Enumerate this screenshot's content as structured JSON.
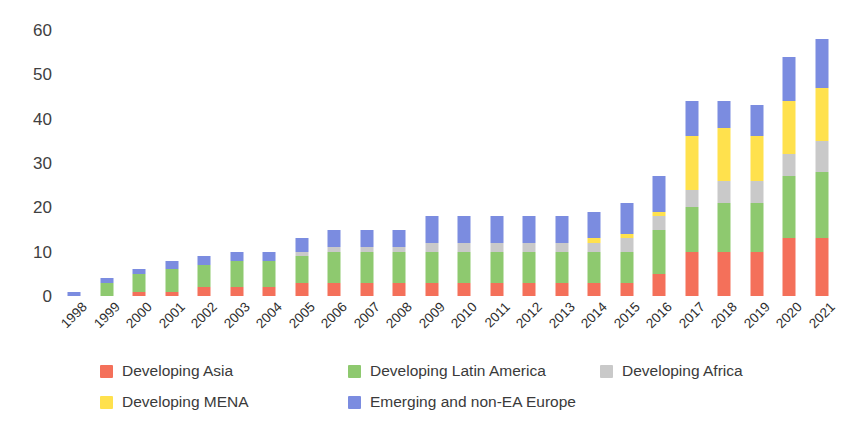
{
  "chart_data": {
    "type": "bar",
    "subtype": "stacked-bar",
    "title": "",
    "xlabel": "",
    "ylabel": "",
    "ylim": [
      0,
      60
    ],
    "yticks": [
      0,
      10,
      20,
      30,
      40,
      50,
      60
    ],
    "grid": false,
    "legend_position": "bottom",
    "categories": [
      "1998",
      "1999",
      "2000",
      "2001",
      "2002",
      "2003",
      "2004",
      "2005",
      "2006",
      "2007",
      "2008",
      "2009",
      "2010",
      "2011",
      "2012",
      "2013",
      "2014",
      "2015",
      "2016",
      "2017",
      "2018",
      "2019",
      "2020",
      "2021"
    ],
    "series": [
      {
        "name": "Developing Asia",
        "color": "#f4705a",
        "values": [
          0,
          0,
          1,
          1,
          2,
          2,
          2,
          3,
          3,
          3,
          3,
          3,
          3,
          3,
          3,
          3,
          3,
          3,
          5,
          10,
          10,
          10,
          13,
          13
        ]
      },
      {
        "name": "Developing Latin America",
        "color": "#8ec96f",
        "values": [
          0,
          3,
          4,
          5,
          5,
          6,
          6,
          6,
          7,
          7,
          7,
          7,
          7,
          7,
          7,
          7,
          7,
          7,
          10,
          10,
          11,
          11,
          14,
          15
        ]
      },
      {
        "name": "Developing Africa",
        "color": "#c9c9c9",
        "values": [
          0,
          0,
          0,
          0,
          0,
          0,
          0,
          1,
          1,
          1,
          1,
          2,
          2,
          2,
          2,
          2,
          2,
          3,
          3,
          4,
          5,
          5,
          5,
          7
        ]
      },
      {
        "name": "Developing MENA",
        "color": "#ffe14d",
        "values": [
          0,
          0,
          0,
          0,
          0,
          0,
          0,
          0,
          0,
          0,
          0,
          0,
          0,
          0,
          0,
          0,
          1,
          1,
          1,
          12,
          12,
          10,
          12,
          12
        ]
      },
      {
        "name": "Emerging and non-EA Europe",
        "color": "#7b8ce0",
        "values": [
          1,
          1,
          1,
          2,
          2,
          2,
          2,
          3,
          4,
          4,
          4,
          6,
          6,
          6,
          6,
          6,
          6,
          7,
          8,
          8,
          6,
          7,
          10,
          11
        ]
      }
    ],
    "totals": [
      1,
      4,
      6,
      8,
      9,
      10,
      10,
      13,
      15,
      15,
      15,
      18,
      18,
      18,
      18,
      18,
      19,
      21,
      27,
      44,
      44,
      43,
      54,
      58
    ]
  },
  "legend": {
    "items": [
      {
        "label": "Developing Asia",
        "color": "#f4705a"
      },
      {
        "label": "Developing Latin America",
        "color": "#8ec96f"
      },
      {
        "label": "Developing Africa",
        "color": "#c9c9c9"
      },
      {
        "label": "Developing MENA",
        "color": "#ffe14d"
      },
      {
        "label": "Emerging and non-EA Europe",
        "color": "#7b8ce0"
      }
    ]
  }
}
